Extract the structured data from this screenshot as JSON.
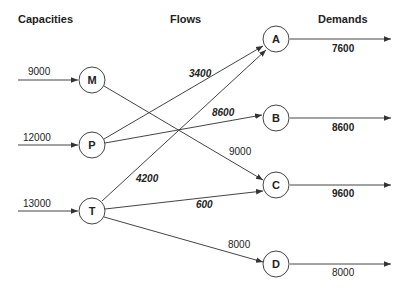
{
  "headers": {
    "capacities": "Capacities",
    "flows": "Flows",
    "demands": "Demands"
  },
  "sources": [
    {
      "id": "M",
      "label": "M",
      "capacity": "9000"
    },
    {
      "id": "P",
      "label": "P",
      "capacity": "12000"
    },
    {
      "id": "T",
      "label": "T",
      "capacity": "13000"
    }
  ],
  "sinks": [
    {
      "id": "A",
      "label": "A",
      "demand": "7600"
    },
    {
      "id": "B",
      "label": "B",
      "demand": "8600"
    },
    {
      "id": "C",
      "label": "C",
      "demand": "9600"
    },
    {
      "id": "D",
      "label": "D",
      "demand": "8000"
    }
  ],
  "flows": [
    {
      "from": "P",
      "to": "A",
      "value": "3400",
      "style": "bold-italic"
    },
    {
      "from": "P",
      "to": "B",
      "value": "8600",
      "style": "bold-italic"
    },
    {
      "from": "M",
      "to": "C",
      "value": "9000",
      "style": "regular"
    },
    {
      "from": "T",
      "to": "A",
      "value": "4200",
      "style": "bold-italic"
    },
    {
      "from": "T",
      "to": "C",
      "value": "600",
      "style": "bold-italic"
    },
    {
      "from": "T",
      "to": "D",
      "value": "8000",
      "style": "regular"
    }
  ],
  "colors": {
    "line": "#444444",
    "text": "#222222",
    "background": "#ffffff"
  }
}
